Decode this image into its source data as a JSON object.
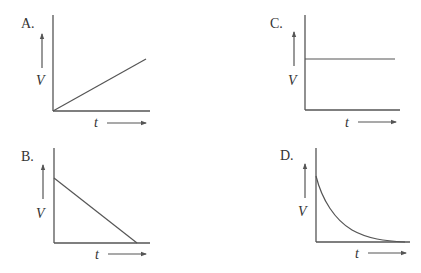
{
  "panels": [
    {
      "id": "A",
      "label": "A.",
      "ylabel": "V",
      "xlabel": "t",
      "shape": "linear-increasing"
    },
    {
      "id": "B",
      "label": "B.",
      "ylabel": "V",
      "xlabel": "t",
      "shape": "linear-decreasing"
    },
    {
      "id": "C",
      "label": "C.",
      "ylabel": "V",
      "xlabel": "t",
      "shape": "constant"
    },
    {
      "id": "D",
      "label": "D.",
      "ylabel": "V",
      "xlabel": "t",
      "shape": "exponential-decay"
    }
  ],
  "colors": {
    "line": "#555555",
    "text": "#333333",
    "background": "#ffffff"
  }
}
